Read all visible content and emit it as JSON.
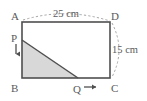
{
  "figure": {
    "type": "geometry-diagram",
    "background_color": "#ffffff",
    "stroke_color": "#4f4f4f",
    "dashed_color": "#9a9a9a",
    "shade_fill": "#d8d8d8",
    "label_color": "#5a5a5a",
    "vertices": [
      {
        "name": "A",
        "label": "A",
        "x": 22,
        "y": 22,
        "label_x": 11,
        "label_y": 20
      },
      {
        "name": "D",
        "label": "D",
        "x": 110,
        "y": 22,
        "label_x": 110,
        "label_y": 20
      },
      {
        "name": "B",
        "label": "B",
        "x": 22,
        "y": 78,
        "label_x": 11,
        "label_y": 92
      },
      {
        "name": "C",
        "label": "C",
        "x": 110,
        "y": 78,
        "label_x": 110,
        "label_y": 92
      }
    ],
    "moving_points": [
      {
        "name": "P",
        "label": "P",
        "x": 22,
        "y": 40,
        "label_x": 11,
        "label_y": 41,
        "direction": "down"
      },
      {
        "name": "Q",
        "label": "Q",
        "x": 78,
        "y": 78,
        "label_x": 74,
        "label_y": 92,
        "direction": "right"
      }
    ],
    "dimensions": [
      {
        "name": "top-width",
        "label": "25 cm",
        "value": 25,
        "unit": "cm",
        "side": "AD",
        "label_x": 66,
        "label_y": 17
      },
      {
        "name": "right-height",
        "label": "15 cm",
        "value": 15,
        "unit": "cm",
        "side": "DC",
        "label_x": 113,
        "label_y": 52
      }
    ],
    "shaded_region": {
      "name": "triangle-PBQ",
      "points": "P,B,Q",
      "polygon": "22,40 22,78 78,78"
    },
    "arrows": [
      {
        "name": "p-down-arrow",
        "from_x": 16,
        "from_y": 44,
        "to_x": 16,
        "to_y": 55
      },
      {
        "name": "q-right-arrow",
        "from_x": 84,
        "from_y": 87,
        "to_x": 97,
        "to_y": 87
      }
    ]
  }
}
